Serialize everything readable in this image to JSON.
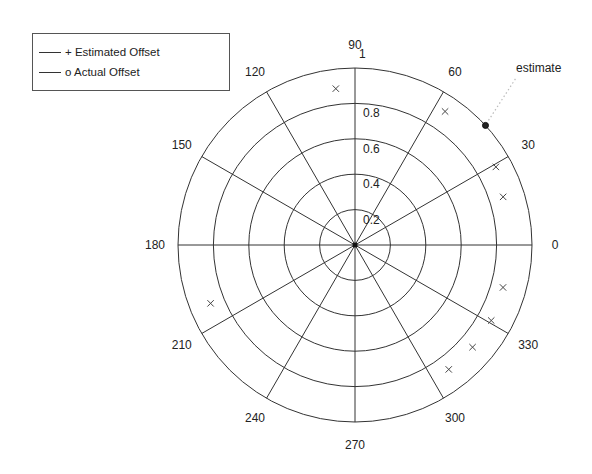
{
  "chart_data": {
    "type": "scatter",
    "subtype": "polar",
    "title": "",
    "center_px": [
      355,
      245
    ],
    "radius_px": 177,
    "rlim": [
      0,
      1
    ],
    "radial_ticks": [
      "0.2",
      "0.4",
      "0.6",
      "0.8",
      "1"
    ],
    "radial_tick_values": [
      0.2,
      0.4,
      0.6,
      0.8,
      1.0
    ],
    "angle_ticks": [
      "0",
      "30",
      "60",
      "90",
      "120",
      "150",
      "180",
      "210",
      "240",
      "270",
      "300",
      "330"
    ],
    "angle_tick_values": [
      0,
      30,
      60,
      90,
      120,
      150,
      180,
      210,
      240,
      270,
      300,
      330
    ],
    "grid": true,
    "legend_position": "upper-left",
    "series": [
      {
        "name": "+ Estimated Offset",
        "marker": "x",
        "points": [
          {
            "theta": 97,
            "r": 0.89
          },
          {
            "theta": 56,
            "r": 0.91
          },
          {
            "theta": 29,
            "r": 0.91
          },
          {
            "theta": 18,
            "r": 0.88
          },
          {
            "theta": 344,
            "r": 0.87
          },
          {
            "theta": 331,
            "r": 0.88
          },
          {
            "theta": 319,
            "r": 0.88
          },
          {
            "theta": 307,
            "r": 0.88
          },
          {
            "theta": 202,
            "r": 0.88
          }
        ]
      },
      {
        "name": "o Actual Offset",
        "marker": "o",
        "points": [
          {
            "theta": 42.5,
            "r": 1.0
          }
        ]
      }
    ],
    "annotations": [
      {
        "text": "estimate",
        "x_px": 516,
        "y_px": 72,
        "target_theta": 42.5,
        "target_r": 1.0,
        "leader": "dotted"
      }
    ]
  },
  "legend": {
    "items": [
      {
        "label": "+ Estimated Offset"
      },
      {
        "label": "o Actual Offset"
      }
    ]
  },
  "colors": {
    "axis": "#333333",
    "text": "#222222",
    "marker": "#444444",
    "leader": "#bbbbbb"
  }
}
